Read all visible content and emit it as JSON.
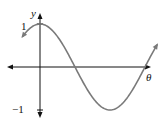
{
  "chart_data": {
    "type": "line",
    "title": "",
    "function": "y = cos(theta)",
    "xlabel": "θ",
    "ylabel": "y",
    "y_tick_labels": [
      "1",
      "−1"
    ],
    "ylim": [
      -1,
      1
    ],
    "grid": false,
    "legend": null,
    "series": [
      {
        "name": "cos θ",
        "x_radians": [
          -0.8,
          0,
          0.785,
          1.571,
          2.356,
          3.142,
          3.927,
          4.712,
          5.3
        ],
        "values": [
          0.7,
          1.0,
          0.71,
          0.0,
          -0.71,
          -1.0,
          -0.71,
          0.0,
          0.55
        ]
      }
    ],
    "colors": {
      "curve": "#7a7a7a",
      "axes": "#111111"
    }
  },
  "labels": {
    "y_axis": "y",
    "x_axis": "θ",
    "tick_max": "1",
    "tick_min": "−1"
  }
}
